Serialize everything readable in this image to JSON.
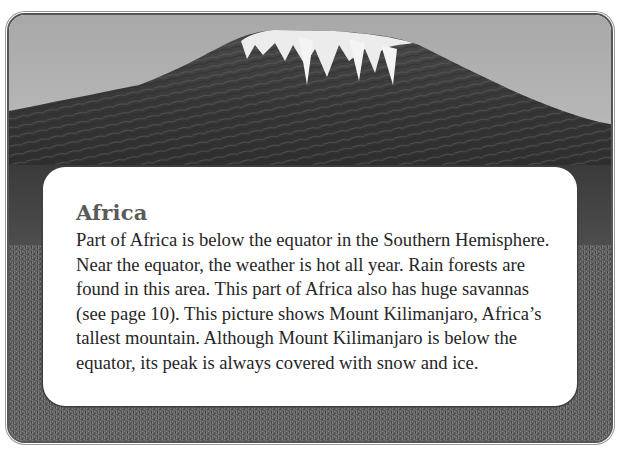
{
  "page": {
    "photo": {
      "subject": "Mount Kilimanjaro",
      "icon": "mountain-photo",
      "colors": {
        "sky_top": "#a8a8a8",
        "sky_bottom": "#d4d4d4",
        "rock": "#3a3a3a",
        "snow": "#f2f2f2",
        "ground": "#5b5b5b"
      }
    },
    "panel": {
      "title": "Africa",
      "lines": [
        "Part of Africa is below the equator in the Southern Hemisphere.",
        "Near the equator, the weather is hot all year. Rain forests are",
        "found in this area. This part of Africa also has huge savannas",
        "(see page 10). This picture shows Mount Kilimanjaro, Africa’s",
        "tallest mountain. Although Mount Kilimanjaro is below the",
        "equator, its peak is always covered with snow and ice."
      ]
    }
  }
}
